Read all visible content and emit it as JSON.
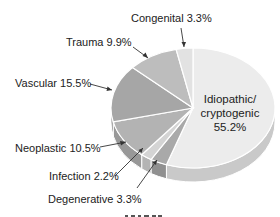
{
  "chart_data": {
    "type": "pie",
    "style": "3d-exploded-edge",
    "title": "",
    "slices": [
      {
        "label": "Idiopathic/ cryptogenic",
        "value": 55.2,
        "color": "#ececec"
      },
      {
        "label": "Degenerative",
        "value": 3.3,
        "color": "#a9a9a9"
      },
      {
        "label": "Infection",
        "value": 2.2,
        "color": "#d4d4d4"
      },
      {
        "label": "Neoplastic",
        "value": 10.5,
        "color": "#b3b3b3"
      },
      {
        "label": "Vascular",
        "value": 15.5,
        "color": "#a6a6a6"
      },
      {
        "label": "Trauma",
        "value": 9.9,
        "color": "#bdbdbd"
      },
      {
        "label": "Congenital",
        "value": 3.3,
        "color": "#e2e2e2"
      }
    ],
    "unit": "%"
  },
  "labels": {
    "congenital": "Congenital 3.3%",
    "trauma": "Trauma 9.9%",
    "vascular": "Vascular 15.5%",
    "neoplastic": "Neoplastic 10.5%",
    "infection": "Infection 2.2%",
    "degenerative": "Degenerative 3.3%",
    "idiopathic_line1": "Idiopathic/",
    "idiopathic_line2": "cryptogenic",
    "idiopathic_line3": "55.2%"
  }
}
